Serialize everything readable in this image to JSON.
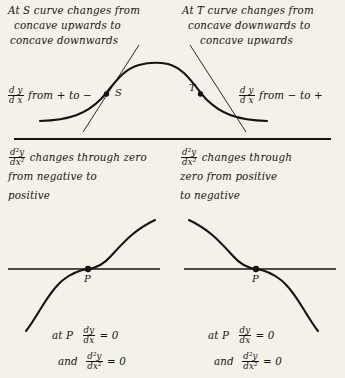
{
  "document": {
    "title": "Points of inflection — concavity and derivative sign changes",
    "background_color": "#f4f1e9",
    "ink_color": "#141414"
  },
  "top_section": {
    "left_column": {
      "heading_lines": [
        "At S curve changes from",
        "concave upwards to",
        "concave downwards"
      ],
      "derivative_note": {
        "fraction_numerator": "d y",
        "fraction_denominator": "d x",
        "text": "from + to −"
      }
    },
    "right_column": {
      "heading_lines": [
        "At T curve changes from",
        "concave downwards to",
        "concave upwards"
      ],
      "derivative_note": {
        "fraction_numerator": "d y",
        "fraction_denominator": "d x",
        "text": "from − to +"
      }
    },
    "figure": {
      "type": "bell-curve",
      "point_labels": [
        "S",
        "T"
      ],
      "description": "Bell shaped curve with tangent lines drawn at inflection points S and T"
    }
  },
  "middle_section": {
    "left_column": {
      "fraction": {
        "numerator": "d²y",
        "denominator": "dx²"
      },
      "lines": [
        "changes through zero",
        "from negative to",
        "positive"
      ]
    },
    "right_column": {
      "fraction": {
        "numerator": "d²y",
        "denominator": "dx²"
      },
      "lines": [
        "changes through",
        "zero from positive",
        "to negative"
      ]
    }
  },
  "bottom_section": {
    "left_figure": {
      "type": "rising-inflection-curve",
      "point_label": "P",
      "description": "Increasing cubic curve crossing horizontal tangent at P"
    },
    "right_figure": {
      "type": "falling-inflection-curve",
      "point_label": "P",
      "description": "Decreasing cubic curve crossing horizontal tangent at P"
    },
    "left_formulas": {
      "line1_prefix": "at P",
      "line1_numerator": "dy",
      "line1_denominator": "dx",
      "line1_equals": "= 0",
      "line2_prefix": "and",
      "line2_numerator": "d²y",
      "line2_denominator": "dx²",
      "line2_equals": "= 0"
    },
    "right_formulas": {
      "line1_prefix": "at P",
      "line1_numerator": "dy",
      "line1_denominator": "dx",
      "line1_equals": "= 0",
      "line2_prefix": "and",
      "line2_numerator": "d²y",
      "line2_denominator": "dx²",
      "line2_equals": "= 0"
    }
  }
}
